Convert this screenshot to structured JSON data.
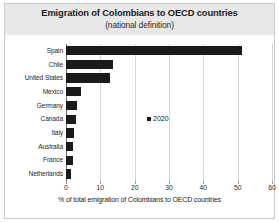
{
  "chart_data": {
    "type": "bar",
    "orientation": "horizontal",
    "title": "Emigration of Colombians to OECD countries",
    "subtitle": "(national definition)",
    "xlabel": "% of total emigration of Colombians to OECD countries",
    "ylabel": "",
    "xlim": [
      0,
      60
    ],
    "xticks": [
      0,
      10,
      20,
      30,
      40,
      50,
      60
    ],
    "xtick_labels": [
      "0",
      "10",
      "20",
      "30",
      "40",
      "50",
      "60"
    ],
    "grid": true,
    "grid_axis": "x",
    "legend_position": "center",
    "series": [
      {
        "name": "2020",
        "color": "#1a1a1a",
        "values": [
          51.2,
          13.7,
          12.8,
          4.4,
          3.2,
          3.0,
          2.4,
          2.0,
          1.9,
          1.5
        ]
      }
    ],
    "categories": [
      "Spain",
      "Chile",
      "United States",
      "Mexico",
      "Germany",
      "Canada",
      "Italy",
      "Australia",
      "France",
      "Netherlands"
    ],
    "legend": [
      {
        "label": "2020",
        "color": "#1a1a1a",
        "marker": "square"
      }
    ]
  },
  "colors": {
    "bar": "#1a1a1a",
    "title_band": "#e8e8e8",
    "gridline": "#d5d5d5",
    "axis": "#6e6e6e",
    "frame": "#c9c9c9",
    "background": "#ffffff",
    "text": "#1b1b1b"
  }
}
